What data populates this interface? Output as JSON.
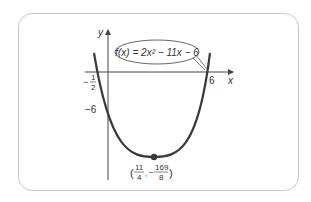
{
  "figure": {
    "function_label": "f(x) = 2x² − 11x − 6",
    "axis_labels": {
      "x": "x",
      "y": "y"
    },
    "x_intercepts": [
      {
        "label_sign": "−",
        "label_num": "1",
        "label_den": "2",
        "value": -0.5
      },
      {
        "label": "6",
        "value": 6
      }
    ],
    "y_intercept": {
      "label": "−6",
      "value": -6
    },
    "vertex": {
      "x_num": "11",
      "x_den": "4",
      "y_sign": "−",
      "y_num": "169",
      "y_den": "8",
      "x": 2.75,
      "y": -21.125
    },
    "colors": {
      "curve": "#3a3a3a",
      "axes": "#444444",
      "border": "#c9c9c9",
      "vertex_dot": "#3a3a3a"
    }
  }
}
